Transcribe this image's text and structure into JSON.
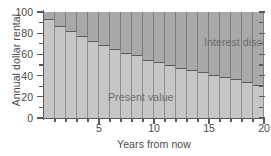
{
  "chart_data": {
    "type": "bar",
    "title": "",
    "subtitle": "",
    "xlabel": "Years from now",
    "ylabel": "Annual dollar rental",
    "xlim": [
      0,
      20
    ],
    "ylim": [
      0,
      100
    ],
    "grid": false,
    "stacked": true,
    "legend_position": "in-plot-annotations",
    "x_major_ticks": [
      5,
      10,
      15,
      20
    ],
    "x_minor_ticks": [
      1,
      2,
      3,
      4,
      6,
      7,
      8,
      9,
      11,
      12,
      13,
      14,
      16,
      17,
      18,
      19
    ],
    "x_ticklabels": [
      "5",
      "10",
      "15",
      "20"
    ],
    "y_major_ticks": [
      0,
      20,
      40,
      60,
      80,
      100
    ],
    "y_minor_ticks": [
      10,
      30,
      50,
      70,
      90
    ],
    "y_ticklabels": [
      "0",
      "20",
      "40",
      "60",
      "80",
      "100"
    ],
    "categories": [
      1,
      2,
      3,
      4,
      5,
      6,
      7,
      8,
      9,
      10,
      11,
      12,
      13,
      14,
      15,
      16,
      17,
      18,
      19,
      20
    ],
    "total": 100,
    "series": [
      {
        "name": "Present value",
        "color": "#c6c6c6",
        "values": [
          93,
          87,
          82,
          77,
          73,
          69,
          65,
          61,
          59,
          55,
          53,
          50,
          47,
          45,
          43,
          41,
          39,
          37,
          34,
          31
        ]
      },
      {
        "name": "Interest discount",
        "color": "#a9a9a9",
        "values": [
          7,
          13,
          18,
          23,
          27,
          31,
          35,
          39,
          41,
          45,
          47,
          50,
          53,
          55,
          57,
          59,
          61,
          63,
          66,
          69
        ]
      }
    ],
    "annotations": [
      {
        "text": "Interest discount",
        "x": 13.5,
        "y": 88
      },
      {
        "text": "Present value",
        "x": 2.8,
        "y": 40
      }
    ]
  },
  "axes": {
    "y_title": "Annual dollar rental",
    "x_title": "Years from now"
  },
  "labels": {
    "interest_discount": "Interest discount",
    "present_value": "Present value"
  },
  "colors": {
    "present_value": "#c6c6c6",
    "interest_discount": "#a9a9a9",
    "plot_background": "#cfcfcf",
    "axis": "#5a5a5a",
    "text": "#4a4a4a",
    "annotation_text": "#6d6d6d",
    "page_background": "#ffffff"
  }
}
